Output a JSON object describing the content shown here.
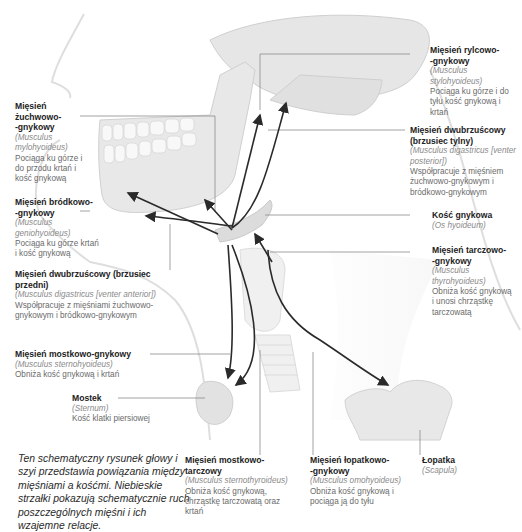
{
  "labels": {
    "zuchwowo": {
      "title": "Mięsień żuchwowo-\n-gnykowy",
      "latin": "(Musculus mylohyoideus)",
      "desc": "Pociąga ku górze i do przodu krtań i kość gnykową"
    },
    "brodkowo": {
      "title": "Mięsień bródkowo-\n-gnykowy",
      "latin": "(Musculus geniohyoideus)",
      "desc": "Pociąga ku górze krtań i kość gnykową"
    },
    "dwubrzuscowy_przedni": {
      "title": "Mięsień dwubrzuścowy (brzusiec przedni)",
      "latin": "(Musculus digastricus [venter anterior])",
      "desc": "Współpracuje z mięśniami żuchwowo-gnykowym i bródkowo-gnykowym"
    },
    "mostkowo_gnykowy": {
      "title": "Mięsień mostkowo-gnykowy",
      "latin": "(Musculus sternohyoideus)",
      "desc": "Obniża kość gnykową i krtań"
    },
    "mostek": {
      "title": "Mostek",
      "latin": "(Sternum)",
      "desc": "Kość klatki piersiowej"
    },
    "rylcowo": {
      "title": "Mięsień rylcowo-\n-gnykowy",
      "latin": "(Musculus stylohyoideus)",
      "desc": "Pociąga ku górze i do tyłu kość gnykową i krtań"
    },
    "dwubrzuscowy_tylny": {
      "title": "Mięsień dwubrzuścowy (brzusiec tylny)",
      "latin": "(Musculus digastricus [venter posterior])",
      "desc": "Współpracuje z mięśniem żuchwowo-gnykowym i bródkowo-gnykowym"
    },
    "kosc_gnykowa": {
      "title": "Kość gnykowa",
      "latin": "(Os hyoideum)",
      "desc": ""
    },
    "tarczowo": {
      "title": "Mięsień tarczowo-\n-gnykowy",
      "latin": "(Musculus thyrohyoideus)",
      "desc": "Obniża kość gnykową i unosi chrząstkę tarczowatą"
    },
    "mostkowo_tarczowy": {
      "title": "Mięsień mostkowo-tarczowy",
      "latin": "(Musculus sternothyroideus)",
      "desc": "Obniża kość gnykową, chrząstkę tarczowatą oraz krtań"
    },
    "lopatkowo": {
      "title": "Mięsień łopatkowo-\n-gnykowy",
      "latin": "(Musculus omohyoideus)",
      "desc": "Obniża kość gnykową i pociąga ją do tyłu"
    },
    "lopatka": {
      "title": "Łopatka",
      "latin": "(Scapula)",
      "desc": ""
    }
  },
  "caption": "Ten schematyczny rysunek głowy i szyi przedstawia powiązania między mięśniami a kośćmi. Niebieskie strzałki pokazują schematycznie ruch poszczególnych mięśni i ich wzajemne relacje.",
  "colors": {
    "arrow": "#2a2a2a",
    "leader": "#888888",
    "bone": "#e4e4e4",
    "skin": "#eeeeee"
  }
}
